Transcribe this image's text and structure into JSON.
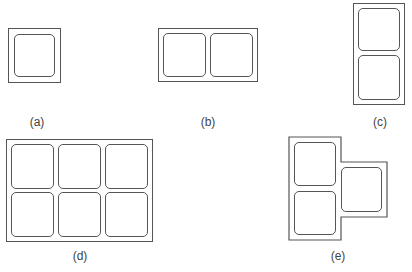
{
  "figures": [
    {
      "id": "a",
      "label": "(a)",
      "description": "single compartment",
      "cells": 1
    },
    {
      "id": "b",
      "label": "(b)",
      "description": "two compartments side by side",
      "cells": 2
    },
    {
      "id": "c",
      "label": "(c)",
      "description": "two compartments stacked vertically",
      "cells": 2
    },
    {
      "id": "d",
      "label": "(d)",
      "description": "six compartments in 2x3 grid",
      "cells": 6
    },
    {
      "id": "e",
      "label": "(e)",
      "description": "three compartments in L/T shape",
      "cells": 3
    }
  ],
  "colors": {
    "stroke": "#555555",
    "background": "#ffffff",
    "label": "#444444"
  }
}
